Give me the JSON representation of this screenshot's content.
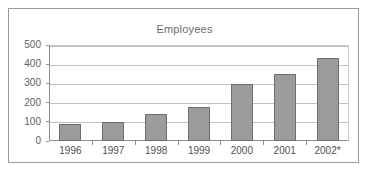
{
  "chart_data": {
    "type": "bar",
    "title": "Employees",
    "xlabel": "",
    "ylabel": "",
    "categories": [
      "1996",
      "1997",
      "1998",
      "1999",
      "2000",
      "2001",
      "2002*"
    ],
    "values": [
      88,
      100,
      140,
      175,
      295,
      350,
      430
    ],
    "ylim": [
      0,
      500
    ],
    "yticks": [
      0,
      100,
      200,
      300,
      400,
      500
    ],
    "ytick_labels": [
      "0",
      "100",
      "200",
      "300",
      "400",
      "500"
    ],
    "grid": true,
    "legend": false,
    "legend_position": "none",
    "series": [
      {
        "name": "Employees",
        "values": [
          88,
          100,
          140,
          175,
          295,
          350,
          430
        ]
      }
    ],
    "colors": {
      "bar_fill": "#9c9c9c",
      "bar_border": "#6e6e6e",
      "gridline": "#c2c2c2",
      "axis": "#8f8f8f",
      "frame": "#9a9a9a",
      "title_text": "#6b6b6b",
      "tick_text": "#5e5e5e",
      "background": "#ffffff"
    },
    "annotations": [
      "2002* denotes projected figure"
    ]
  }
}
